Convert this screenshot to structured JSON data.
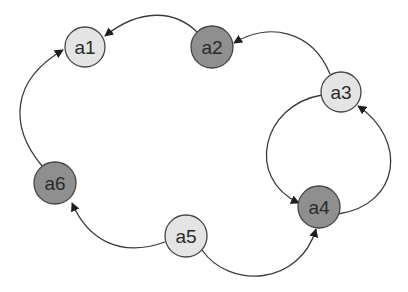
{
  "diagram": {
    "type": "directed-graph",
    "colors": {
      "light_node": "#e4e4e4",
      "dark_node": "#8f8f8f",
      "edge": "#3a3a3a",
      "background": "#ffffff"
    },
    "nodes": [
      {
        "id": "a1",
        "label": "a1",
        "shade": "light",
        "cx": 85,
        "cy": 47,
        "r": 20
      },
      {
        "id": "a2",
        "label": "a2",
        "shade": "dark",
        "cx": 212,
        "cy": 47,
        "r": 21
      },
      {
        "id": "a3",
        "label": "a3",
        "shade": "light",
        "cx": 341,
        "cy": 92,
        "r": 20
      },
      {
        "id": "a4",
        "label": "a4",
        "shade": "dark",
        "cx": 319,
        "cy": 207,
        "r": 21
      },
      {
        "id": "a5",
        "label": "a5",
        "shade": "light",
        "cx": 186,
        "cy": 236,
        "r": 21
      },
      {
        "id": "a6",
        "label": "a6",
        "shade": "dark",
        "cx": 55,
        "cy": 183,
        "r": 21
      }
    ],
    "edges": [
      {
        "from": "a2",
        "to": "a1"
      },
      {
        "from": "a3",
        "to": "a2"
      },
      {
        "from": "a3",
        "to": "a4"
      },
      {
        "from": "a4",
        "to": "a3"
      },
      {
        "from": "a5",
        "to": "a4"
      },
      {
        "from": "a5",
        "to": "a6"
      },
      {
        "from": "a6",
        "to": "a1"
      }
    ]
  }
}
